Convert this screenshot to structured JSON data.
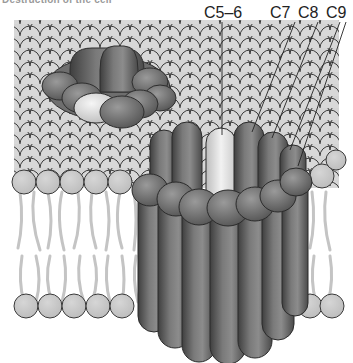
{
  "figure": {
    "caption": "Destruction of the cell",
    "colors": {
      "background": "#ffffff",
      "lipid_head": "#c8c8c8",
      "lipid_outline": "#3a3a3a",
      "lipid_tail": "#c4c4c4",
      "protein_dark": "#5a5a5a",
      "protein_mid": "#7a7a7a",
      "protein_light": "#e6e6e6"
    },
    "labels": [
      {
        "id": "c5-6",
        "text": "C5–6"
      },
      {
        "id": "c7",
        "text": "C7"
      },
      {
        "id": "c8",
        "text": "C8"
      },
      {
        "id": "c9",
        "text": "C9"
      }
    ],
    "structures": {
      "membrane": "lipid-bilayer",
      "small_pore": "pore-top-view",
      "large_pore": "pore-cross-section"
    }
  }
}
